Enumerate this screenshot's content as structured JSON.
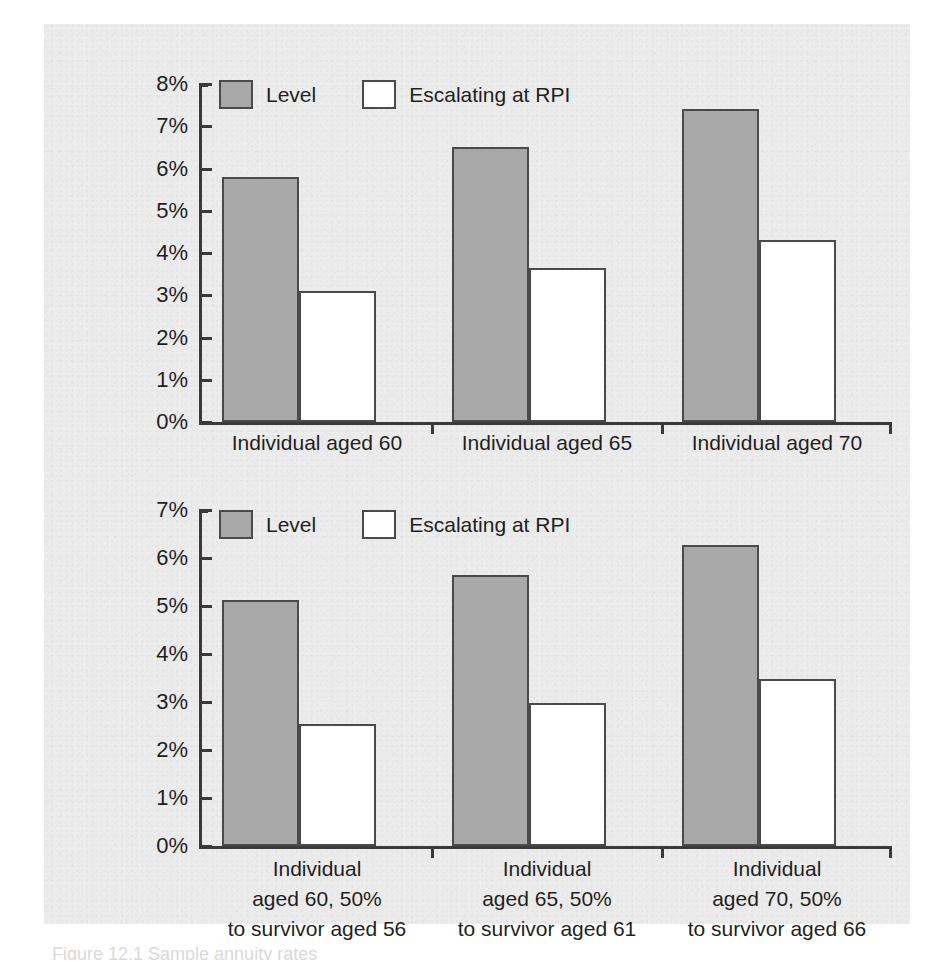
{
  "figure": {
    "background_color": "#ececec",
    "page_color": "#ffffff",
    "caption_partial": "Figure 12.1  Sample annuity rates"
  },
  "legend_labels": {
    "level": "Level",
    "escalating": "Escalating at RPI"
  },
  "colors": {
    "level_fill": "#a8a8a8",
    "escalating_fill": "#ffffff",
    "outline": "#4a4a4a",
    "axis": "#3a3a3a",
    "text": "#1f1f1f"
  },
  "chart_data": [
    {
      "type": "bar",
      "id": "single-life-annuity-rates",
      "title": "",
      "xlabel": "",
      "ylabel": "",
      "ylim": [
        0,
        8
      ],
      "ytick_labels": [
        "0%",
        "1%",
        "2%",
        "3%",
        "4%",
        "5%",
        "6%",
        "7%",
        "8%"
      ],
      "ytick_values": [
        0,
        1,
        2,
        3,
        4,
        5,
        6,
        7,
        8
      ],
      "grid": false,
      "legend_position": "top-left-inside",
      "categories": [
        "Individual aged 60",
        "Individual aged 65",
        "Individual aged 70"
      ],
      "series": [
        {
          "name": "Level",
          "values": [
            5.8,
            6.5,
            7.4
          ]
        },
        {
          "name": "Escalating at RPI",
          "values": [
            3.1,
            3.65,
            4.3
          ]
        }
      ]
    },
    {
      "type": "bar",
      "id": "joint-life-annuity-rates",
      "title": "",
      "xlabel": "",
      "ylabel": "",
      "ylim": [
        0,
        7
      ],
      "ytick_labels": [
        "0%",
        "1%",
        "2%",
        "3%",
        "4%",
        "5%",
        "6%",
        "7%"
      ],
      "ytick_values": [
        0,
        1,
        2,
        3,
        4,
        5,
        6,
        7
      ],
      "grid": false,
      "legend_position": "top-left-inside",
      "categories": [
        "Individual\naged 60, 50%\nto survivor aged 56",
        "Individual\naged 65, 50%\nto survivor aged 61",
        "Individual\naged 70, 50%\nto survivor aged 66"
      ],
      "category_lines": [
        [
          "Individual",
          "aged 60, 50%",
          "to survivor aged 56"
        ],
        [
          "Individual",
          "aged 65, 50%",
          "to survivor aged 61"
        ],
        [
          "Individual",
          "aged 70, 50%",
          "to survivor aged 66"
        ]
      ],
      "series": [
        {
          "name": "Level",
          "values": [
            5.12,
            5.65,
            6.27
          ]
        },
        {
          "name": "Escalating at RPI",
          "values": [
            2.55,
            2.98,
            3.48
          ]
        }
      ]
    }
  ]
}
